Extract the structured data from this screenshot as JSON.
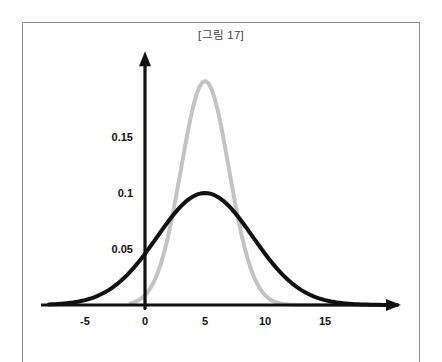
{
  "figure": {
    "title": "[그림 17]",
    "frame_color": "#8a8a8a",
    "background": "#ffffff"
  },
  "chart_data": {
    "type": "line",
    "title": "[그림 17]",
    "xlabel": "",
    "ylabel": "",
    "xlim": [
      -8,
      21
    ],
    "ylim": [
      0,
      0.223
    ],
    "grid": false,
    "legend": null,
    "axis_style": "arrows",
    "xticks": [
      "-5",
      "0",
      "5",
      "10",
      "15"
    ],
    "xtick_values": [
      -5,
      0,
      5,
      10,
      15
    ],
    "yticks": [
      "0.05",
      "0.1",
      "0.15"
    ],
    "ytick_values": [
      0.05,
      0.1,
      0.15
    ],
    "series": [
      {
        "name": "wide-normal-curve",
        "color": "#111111",
        "linewidth": 4,
        "mean": 5,
        "sigma": 4,
        "peak": 0.1,
        "x": [
          -8,
          -6,
          -4,
          -2,
          0,
          1,
          2,
          3,
          4,
          5,
          6,
          7,
          8,
          9,
          10,
          12,
          14,
          16,
          18,
          20,
          21
        ],
        "values": [
          0.0009,
          0.0022,
          0.0046,
          0.0088,
          0.0152,
          0.0194,
          0.0242,
          0.0294,
          0.0348,
          0.0399,
          0.0348,
          0.0294,
          0.0242,
          0.0194,
          0.0152,
          0.0088,
          0.0046,
          0.0022,
          0.0009,
          0.0003,
          0.0002
        ],
        "scaled_values": [
          0.0023,
          0.0055,
          0.0115,
          0.0221,
          0.0381,
          0.0486,
          0.0607,
          0.0736,
          0.0872,
          0.1,
          0.0872,
          0.0736,
          0.0607,
          0.0486,
          0.0381,
          0.0221,
          0.0115,
          0.0055,
          0.0023,
          0.0008,
          0.0004
        ]
      },
      {
        "name": "narrow-normal-curve",
        "color": "#c3c3c3",
        "linewidth": 4,
        "mean": 5,
        "sigma": 2,
        "peak": 0.2,
        "x": [
          -1,
          0,
          1,
          2,
          3,
          4,
          5,
          6,
          7,
          8,
          9,
          10,
          11,
          12,
          13,
          14,
          16,
          18,
          21
        ],
        "values": [
          0.0022,
          0.0044,
          0.0088,
          0.0162,
          0.027,
          0.0403,
          0.0532,
          0.0403,
          0.027,
          0.0162,
          0.0088,
          0.0044,
          0.0022,
          0.0009,
          0.0003,
          0.0001,
          0.0,
          0.0,
          0.0
        ],
        "scaled_values": [
          0.0082,
          0.0165,
          0.0331,
          0.0609,
          0.1015,
          0.1515,
          0.2,
          0.1515,
          0.1015,
          0.0609,
          0.0331,
          0.0165,
          0.0082,
          0.0034,
          0.0011,
          0.0004,
          0.0,
          0.0,
          0.0
        ]
      }
    ]
  }
}
